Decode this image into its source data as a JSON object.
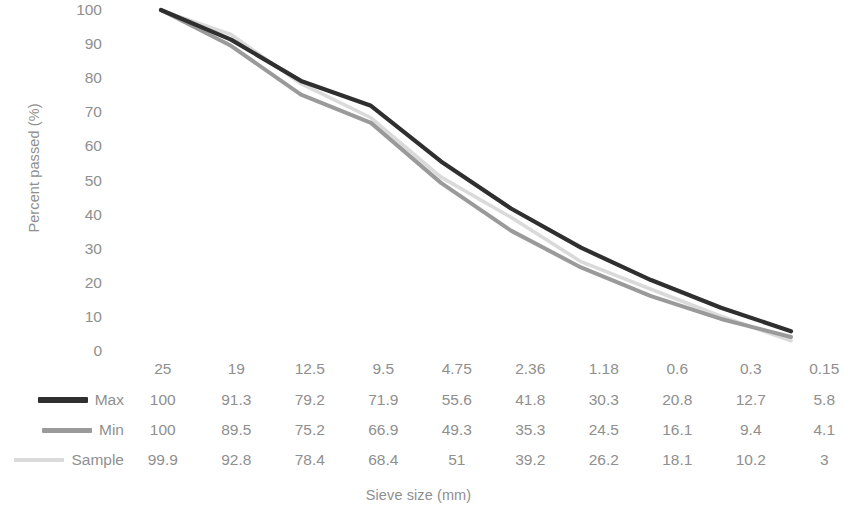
{
  "chart_data": {
    "type": "line",
    "title": "",
    "xlabel": "Sieve size (mm)",
    "ylabel": "Percent passed (%)",
    "categories": [
      "25",
      "19",
      "12.5",
      "9.5",
      "4.75",
      "2.36",
      "1.18",
      "0.6",
      "0.3",
      "0.15"
    ],
    "ylim": [
      0,
      100
    ],
    "ytick_labels": [
      "100",
      "90",
      "80",
      "70",
      "60",
      "50",
      "40",
      "30",
      "20",
      "10",
      "0"
    ],
    "ytick_values": [
      100,
      90,
      80,
      70,
      60,
      50,
      40,
      30,
      20,
      10,
      0
    ],
    "grid": false,
    "legend_position": "table-left",
    "series": [
      {
        "name": "Max",
        "color": "#2f2f2f",
        "values": [
          100,
          91.3,
          79.2,
          71.9,
          55.6,
          41.8,
          30.3,
          20.8,
          12.7,
          5.8
        ],
        "labels": [
          "100",
          "91.3",
          "79.2",
          "71.9",
          "55.6",
          "41.8",
          "30.3",
          "20.8",
          "12.7",
          "5.8"
        ]
      },
      {
        "name": "Min",
        "color": "#9a9a9a",
        "values": [
          100,
          89.5,
          75.2,
          66.9,
          49.3,
          35.3,
          24.5,
          16.1,
          9.4,
          4.1
        ],
        "labels": [
          "100",
          "89.5",
          "75.2",
          "66.9",
          "49.3",
          "35.3",
          "24.5",
          "16.1",
          "9.4",
          "4.1"
        ]
      },
      {
        "name": "Sample",
        "color": "#dadada",
        "values": [
          99.9,
          92.8,
          78.4,
          68.4,
          51,
          39.2,
          26.2,
          18.1,
          10.2,
          3
        ],
        "labels": [
          "99.9",
          "92.8",
          "78.4",
          "68.4",
          "51",
          "39.2",
          "26.2",
          "18.1",
          "10.2",
          "3"
        ]
      }
    ]
  },
  "axes": {
    "y_title": "Percent passed (%)",
    "x_title": "Sieve size (mm)",
    "y_ticks": [
      "100",
      "90",
      "80",
      "70",
      "60",
      "50",
      "40",
      "30",
      "20",
      "10",
      "0"
    ]
  },
  "data_table": {
    "header_row": [
      "25",
      "19",
      "12.5",
      "9.5",
      "4.75",
      "2.36",
      "1.18",
      "0.6",
      "0.3",
      "0.15"
    ],
    "rows": [
      {
        "label": "Max",
        "swatch_color": "#2f2f2f",
        "values": [
          "100",
          "91.3",
          "79.2",
          "71.9",
          "55.6",
          "41.8",
          "30.3",
          "20.8",
          "12.7",
          "5.8"
        ]
      },
      {
        "label": "Min",
        "swatch_color": "#9a9a9a",
        "values": [
          "100",
          "89.5",
          "75.2",
          "66.9",
          "49.3",
          "35.3",
          "24.5",
          "16.1",
          "9.4",
          "4.1"
        ]
      },
      {
        "label": "Sample",
        "swatch_color": "#dadada",
        "values": [
          "99.9",
          "92.8",
          "78.4",
          "68.4",
          "51",
          "39.2",
          "26.2",
          "18.1",
          "10.2",
          "3"
        ]
      }
    ]
  },
  "colors": {
    "max": "#2f2f2f",
    "min": "#9a9a9a",
    "sample": "#dadada",
    "text": "#8f8f8f",
    "background": "#ffffff"
  }
}
